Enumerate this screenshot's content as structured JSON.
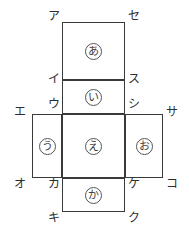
{
  "figure": {
    "stroke_color": "#3a3a3a",
    "label_color": "#2e2e2e",
    "background": "#ffffff"
  },
  "faces": [
    {
      "id": "top",
      "label": "あ",
      "x": 62,
      "y": 22,
      "w": 63,
      "h": 58,
      "cx": 93.5,
      "cy": 51
    },
    {
      "id": "upper",
      "label": "い",
      "x": 62,
      "y": 80,
      "w": 63,
      "h": 34,
      "cx": 93.5,
      "cy": 97
    },
    {
      "id": "left",
      "label": "う",
      "x": 32,
      "y": 114,
      "w": 30,
      "h": 64,
      "cx": 47,
      "cy": 146
    },
    {
      "id": "center",
      "label": "え",
      "x": 62,
      "y": 114,
      "w": 63,
      "h": 64,
      "cx": 93.5,
      "cy": 146
    },
    {
      "id": "right",
      "label": "お",
      "x": 125,
      "y": 114,
      "w": 38,
      "h": 64,
      "cx": 144,
      "cy": 146
    },
    {
      "id": "bottom",
      "label": "か",
      "x": 62,
      "y": 178,
      "w": 63,
      "h": 34,
      "cx": 93.5,
      "cy": 195
    }
  ],
  "vertices": [
    {
      "id": "a",
      "label": "ア",
      "x": 48,
      "y": 10
    },
    {
      "id": "se",
      "label": "セ",
      "x": 128,
      "y": 10
    },
    {
      "id": "i",
      "label": "イ",
      "x": 48,
      "y": 73
    },
    {
      "id": "su",
      "label": "ス",
      "x": 128,
      "y": 73
    },
    {
      "id": "u",
      "label": "ウ",
      "x": 48,
      "y": 98
    },
    {
      "id": "shi",
      "label": "シ",
      "x": 128,
      "y": 98
    },
    {
      "id": "e",
      "label": "エ",
      "x": 14,
      "y": 106
    },
    {
      "id": "sa",
      "label": "サ",
      "x": 166,
      "y": 106
    },
    {
      "id": "o",
      "label": "オ",
      "x": 14,
      "y": 178
    },
    {
      "id": "ko",
      "label": "コ",
      "x": 166,
      "y": 178
    },
    {
      "id": "ka",
      "label": "カ",
      "x": 48,
      "y": 178
    },
    {
      "id": "ke",
      "label": "ケ",
      "x": 128,
      "y": 178
    },
    {
      "id": "ki",
      "label": "キ",
      "x": 48,
      "y": 212
    },
    {
      "id": "ku",
      "label": "ク",
      "x": 128,
      "y": 212
    }
  ]
}
